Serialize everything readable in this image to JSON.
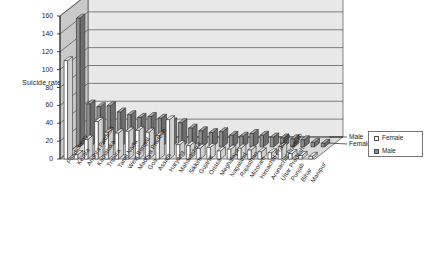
{
  "chart_data": {
    "type": "bar",
    "title": "",
    "subtitle": "",
    "xlabel": "",
    "ylabel": "Suicide rate",
    "ylim": [
      0,
      160
    ],
    "yticks": [
      0,
      20,
      40,
      60,
      80,
      100,
      120,
      140,
      160
    ],
    "grid": true,
    "legend_position": "right",
    "three_d": true,
    "depth_axis_labels": [
      "Male",
      "Female"
    ],
    "categories": [
      "Pondicherry",
      "Kerala",
      "Andhra Pradesh",
      "Karnataka",
      "Tripura",
      "Tamil Nadu",
      "West Bengal",
      "Madhya Pradesh",
      "Goa",
      "Assam",
      "Haryana",
      "Maharashtra",
      "Sikkim",
      "Gujarat",
      "Orissa",
      "Meghalaya",
      "Nagaland",
      "Rajasthan",
      "Mizoram",
      "Himachal Pradesh",
      "Arunachal Pradesh",
      "Uttar Pradesh",
      "Punjab",
      "Bihar",
      "Manipur"
    ],
    "series": [
      {
        "name": "Female",
        "color": "#ffffff",
        "values": [
          110,
          5,
          22,
          42,
          30,
          29,
          31,
          32,
          30,
          26,
          44,
          16,
          15,
          12,
          13,
          9,
          11,
          12,
          10,
          8,
          7,
          14,
          6,
          4,
          3
        ]
      },
      {
        "name": "Male",
        "color": "#8d8d8d",
        "values": [
          144,
          48,
          45,
          46,
          39,
          36,
          33,
          34,
          32,
          28,
          27,
          21,
          18,
          16,
          17,
          13,
          12,
          15,
          13,
          11,
          10,
          9,
          8,
          5,
          4
        ]
      }
    ]
  },
  "legend": {
    "items": [
      {
        "label": "Female",
        "swatch": "female"
      },
      {
        "label": "Male",
        "swatch": "male"
      }
    ]
  },
  "axis": {
    "y_title": "Suicide rate"
  },
  "colors": {
    "plot_floor": "#d9d9d9",
    "back_wall": "#e8e8e8",
    "left_wall": "#c9c9c9",
    "grid_line": "#4d4d4d",
    "bar_female": "#ffffff",
    "bar_male": "#8d8d8d",
    "bar_outline": "#2a2a2a"
  }
}
